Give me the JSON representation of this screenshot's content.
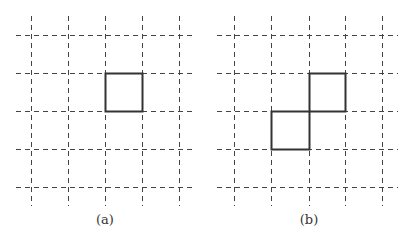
{
  "figure": {
    "panels": [
      {
        "id": "a",
        "caption": "(a)",
        "caption_pos": {
          "x": 105,
          "y": 212
        },
        "grid": {
          "vertical_x": [
            31,
            68,
            105,
            142,
            179
          ],
          "horizontal_y": [
            35,
            73,
            111,
            149,
            187
          ],
          "v_extent": [
            16,
            206
          ],
          "h_extent": [
            16,
            195
          ]
        },
        "cells": [
          {
            "x": 105,
            "y": 73,
            "w": 37,
            "h": 38
          }
        ]
      },
      {
        "id": "b",
        "caption": "(b)",
        "caption_pos": {
          "x": 309,
          "y": 212
        },
        "grid": {
          "vertical_x": [
            234,
            271,
            309,
            345,
            382
          ],
          "horizontal_y": [
            35,
            73,
            111,
            149,
            187
          ],
          "v_extent": [
            16,
            206
          ],
          "h_extent": [
            217,
            398
          ]
        },
        "cells": [
          {
            "x": 309,
            "y": 73,
            "w": 36,
            "h": 38
          },
          {
            "x": 271,
            "y": 111,
            "w": 38,
            "h": 38
          }
        ]
      }
    ],
    "style": {
      "grid_color": "#444444",
      "grid_dash": "5,4",
      "grid_width": 1,
      "cell_color": "#333333",
      "cell_width": 2
    }
  }
}
